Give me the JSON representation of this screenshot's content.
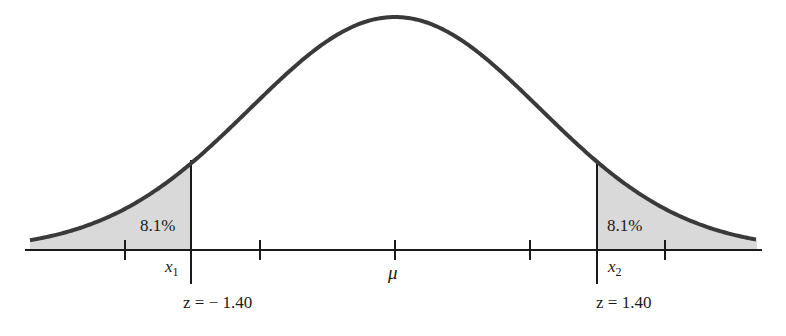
{
  "chart_data": {
    "type": "area",
    "title": "",
    "mean_label": "μ",
    "tails": [
      {
        "side": "left",
        "area_label": "8.1%",
        "x_label": "x",
        "x_sub": "1",
        "z_label": "z = − 1.40",
        "z": -1.4,
        "area": 8.1
      },
      {
        "side": "right",
        "area_label": "8.1%",
        "x_label": "x",
        "x_sub": "2",
        "z_label": "z = 1.40",
        "z": 1.4,
        "area": 8.1
      }
    ],
    "ticks_sd": [
      -2,
      -1,
      0,
      1,
      2
    ],
    "fill_color": "#d9d9d9",
    "curve_color": "#3a3a3a",
    "axis_color": "#1a1a1a"
  },
  "labels": {
    "left_area": "8.1%",
    "right_area": "8.1%",
    "x1": "x",
    "x1_sub": "1",
    "x2": "x",
    "x2_sub": "2",
    "mu": "μ",
    "z_left": "z = − 1.40",
    "z_right": "z = 1.40"
  }
}
